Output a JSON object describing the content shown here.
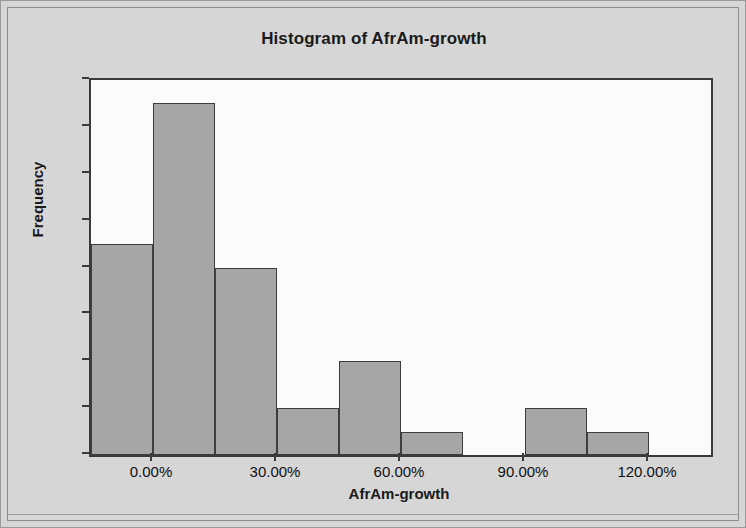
{
  "chart_data": {
    "type": "bar",
    "title": "Histogram of AfrAm-growth",
    "xlabel": "AfrAm-growth",
    "ylabel": "Frequency",
    "categories": [
      "-7.50%",
      "7.50%",
      "22.50%",
      "37.50%",
      "52.50%",
      "67.50%",
      "82.50%",
      "97.50%",
      "112.50%"
    ],
    "bin_edges": [
      -15,
      0,
      15,
      30,
      45,
      60,
      75,
      90,
      105,
      120
    ],
    "bin_width": 15,
    "values": [
      9,
      15,
      8,
      2,
      4,
      1,
      0,
      2,
      1
    ],
    "xlim": [
      -15,
      135
    ],
    "ylim": [
      0,
      16
    ],
    "x_tick_labels": [
      "0.00%",
      "30.00%",
      "60.00%",
      "90.00%",
      "120.00%"
    ],
    "x_tick_values": [
      0,
      30,
      60,
      90,
      120
    ],
    "y_tick_labels": [
      "0",
      "2",
      "4",
      "6",
      "8",
      "10",
      "12",
      "14",
      "16"
    ],
    "y_tick_values": [
      0,
      2,
      4,
      6,
      8,
      10,
      12,
      14,
      16
    ],
    "grid": false,
    "legend": "none",
    "colors": {
      "figure_background": "#d6d6d6",
      "plot_background": "#fbfbfb",
      "bar_fill": "#a6a6a6",
      "bar_edge": "#3d3d3d",
      "axis": "#3a3a3a",
      "text": "#111111"
    }
  }
}
